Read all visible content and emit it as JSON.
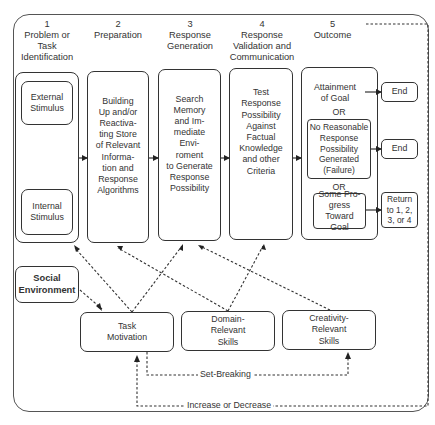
{
  "diagram": {
    "stages": [
      {
        "number": "1",
        "title": "Problem or Task\nIdentification"
      },
      {
        "number": "2",
        "title": "Preparation"
      },
      {
        "number": "3",
        "title": "Response\nGeneration"
      },
      {
        "number": "4",
        "title": "Response\nValidation and\nCommunication"
      },
      {
        "number": "5",
        "title": "Outcome"
      }
    ],
    "stage1": {
      "external": "External\nStimulus",
      "internal": "Internal\nStimulus"
    },
    "stage2_text": "Building\nUp and/or\nReactiva-\nting Store\nof Relevant\nInforma-\ntion and\nResponse\nAlgorithms",
    "stage3_text": "Search\nMemory\nand Im-\nmediate\nEnvi-\nroment\nto Generate\nResponse\nPossibility",
    "stage4_text": "Test\nResponse\nPossibility\nAgainst\nFactual\nKnowledge\nand other\nCriteria",
    "outcome": {
      "attainment": "Attainment\nof Goal",
      "or1": "OR",
      "failure": "No Reasonable\nResponse\nPossibility\nGenerated\n(Failure)",
      "or2": "OR",
      "progress": "Some Pro-\ngress Toward\nGoal",
      "end1": "End",
      "end2": "End",
      "return": "Return\nto 1, 2,\n3, or 4"
    },
    "components": {
      "social": "Social\nEnvironment",
      "task": "Task\nMotivation",
      "domain": "Domain-\nRelevant\nSkills",
      "creativity": "Creativity-\nRelevant\nSkills"
    },
    "feedback_labels": {
      "set_breaking": "Set-Breaking",
      "increase_decrease": "Increase or Decrease"
    },
    "colors": {
      "line": "#333333",
      "text": "#333333",
      "background": "#ffffff"
    }
  }
}
